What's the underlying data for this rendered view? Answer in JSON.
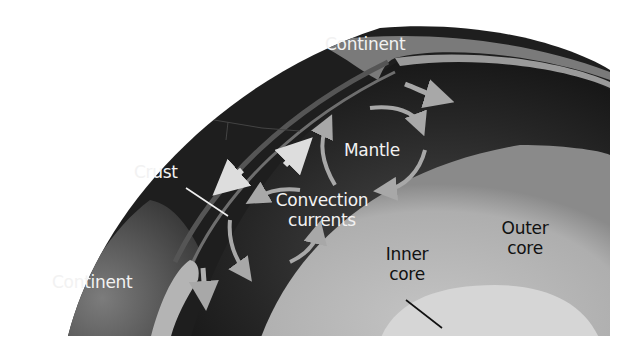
{
  "diagram": {
    "colors": {
      "background": "#ffffff",
      "mantle": "#2a2a2a",
      "crust": "#8a8a8a",
      "outer_core": "#b9b9b9",
      "inner_core": "#d9d9d9",
      "arrow": "#a8a8a8",
      "label_light": "#f2f2f2",
      "label_dark": "#111111"
    },
    "labels": {
      "continent_top": "Continent",
      "mantle": "Mantle",
      "crust": "Crust",
      "convection_line1": "Convection",
      "convection_line2": "currents",
      "continent_left": "Continent",
      "inner_core_line1": "Inner",
      "inner_core_line2": "core",
      "outer_core_line1": "Outer",
      "outer_core_line2": "core"
    },
    "leader_lines": [
      {
        "from": "crust-label",
        "to": "crust-layer"
      },
      {
        "from": "inner-core-label",
        "to": "inner-core"
      }
    ],
    "arrows": [
      {
        "name": "plate-divergence-up",
        "direction": "up-right"
      },
      {
        "name": "plate-divergence-down",
        "direction": "down-left"
      },
      {
        "name": "plate-move-right",
        "direction": "right"
      },
      {
        "name": "subduction-down",
        "direction": "down"
      },
      {
        "name": "convection-cell-upper",
        "direction": "clockwise"
      },
      {
        "name": "convection-cell-lower",
        "direction": "counter-clockwise"
      }
    ]
  }
}
